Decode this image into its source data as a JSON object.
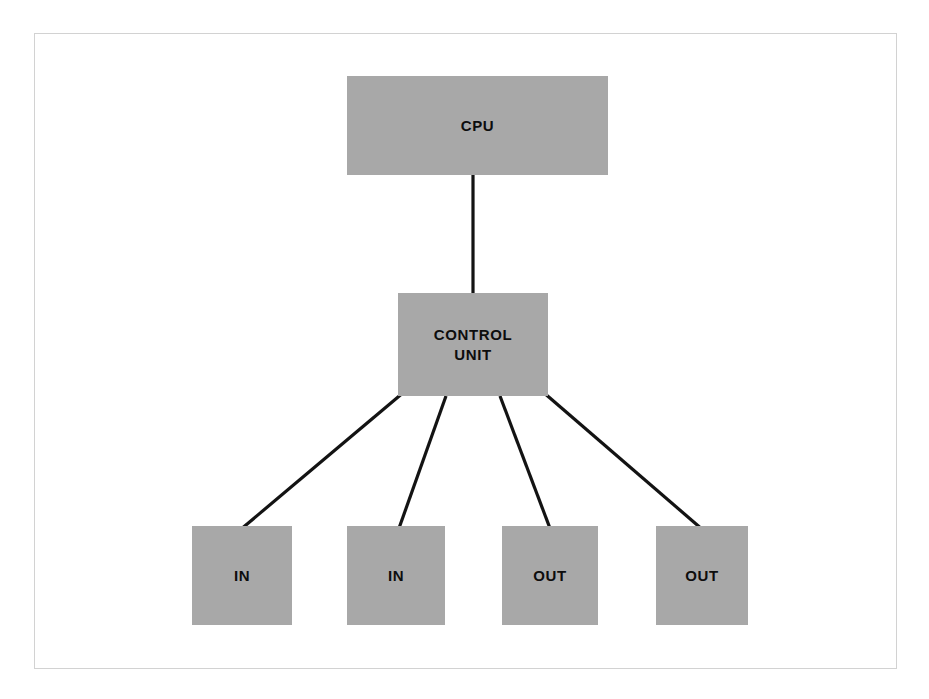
{
  "diagram": {
    "type": "block-diagram",
    "colors": {
      "node_fill": "#a8a8a8",
      "node_text": "#0d0d0d",
      "edge_stroke": "#131313",
      "frame_border": "#d2d2d2",
      "background": "#ffffff"
    },
    "frame": {
      "x": 34,
      "y": 33,
      "width": 863,
      "height": 636
    },
    "nodes": [
      {
        "id": "cpu",
        "label": "CPU",
        "x": 347,
        "y": 76,
        "width": 261,
        "height": 99
      },
      {
        "id": "control",
        "label": "CONTROL\nUNIT",
        "line1": "CONTROL",
        "line2": "UNIT",
        "x": 398,
        "y": 293,
        "width": 150,
        "height": 103
      },
      {
        "id": "in1",
        "label": "IN",
        "x": 192,
        "y": 526,
        "width": 100,
        "height": 99
      },
      {
        "id": "in2",
        "label": "IN",
        "x": 347,
        "y": 526,
        "width": 98,
        "height": 99
      },
      {
        "id": "out1",
        "label": "OUT",
        "x": 502,
        "y": 526,
        "width": 96,
        "height": 99
      },
      {
        "id": "out2",
        "label": "OUT",
        "x": 656,
        "y": 526,
        "width": 92,
        "height": 99
      }
    ],
    "edges": [
      {
        "id": "cpu-control",
        "from": "cpu",
        "to": "control",
        "x1": 473,
        "y1": 175,
        "x2": 473,
        "y2": 293
      },
      {
        "id": "control-in1",
        "from": "control",
        "to": "in1",
        "x1": 404,
        "y1": 392,
        "x2": 240,
        "y2": 530
      },
      {
        "id": "control-in2",
        "from": "control",
        "to": "in2",
        "x1": 446,
        "y1": 396,
        "x2": 398,
        "y2": 531
      },
      {
        "id": "control-out1",
        "from": "control",
        "to": "out1",
        "x1": 500,
        "y1": 396,
        "x2": 551,
        "y2": 531
      },
      {
        "id": "control-out2",
        "from": "control",
        "to": "out2",
        "x1": 543,
        "y1": 392,
        "x2": 703,
        "y2": 530
      }
    ]
  }
}
